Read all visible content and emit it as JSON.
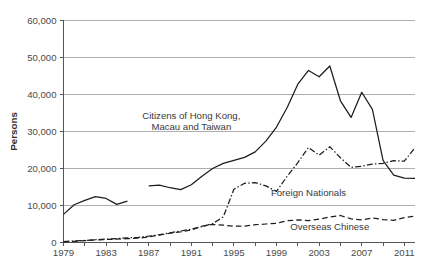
{
  "chart_data": {
    "type": "line",
    "title": "",
    "xlabel": "",
    "ylabel": "Persons",
    "xlim": [
      1979,
      2012
    ],
    "ylim": [
      0,
      60000
    ],
    "grid": true,
    "legend_position": "inline-annotations",
    "y_ticks": [
      0,
      10000,
      20000,
      30000,
      40000,
      50000,
      60000
    ],
    "y_tick_labels": [
      "0",
      "10,000",
      "20,000",
      "30,000",
      "40,000",
      "50,000",
      "60,000"
    ],
    "x_ticks": [
      1979,
      1983,
      1987,
      1991,
      1995,
      1999,
      2003,
      2007,
      2011
    ],
    "x_tick_labels": [
      "1979",
      "1983",
      "1987",
      "1991",
      "1995",
      "1999",
      "2003",
      "2007",
      "2011"
    ],
    "x_minor_tick_interval": 2,
    "series": [
      {
        "name": "Citizens of Hong Kong, Macau and Taiwan",
        "style": "solid",
        "annotation_lines": [
          "Citizens of Hong Kong,",
          "Macau and Taiwan"
        ],
        "annotation_x": 1991.0,
        "annotation_y": 33500,
        "x": [
          1979,
          1980,
          1981,
          1982,
          1983,
          1984,
          1985,
          1987,
          1988,
          1989,
          1990,
          1991,
          1992,
          1993,
          1994,
          1995,
          1996,
          1997,
          1998,
          1999,
          2000,
          2001,
          2002,
          2003,
          2004,
          2005,
          2006,
          2007,
          2008,
          2009,
          2010,
          2011,
          2012
        ],
        "y": [
          7600,
          10200,
          11400,
          12400,
          11900,
          10300,
          11200,
          15300,
          15500,
          14800,
          14300,
          15600,
          17900,
          20000,
          21400,
          22200,
          23000,
          24500,
          27400,
          31200,
          36500,
          42800,
          46500,
          44800,
          47700,
          38300,
          33800,
          40600,
          36000,
          22200,
          18200,
          17400,
          17300
        ]
      },
      {
        "name": "Foreign Nationals",
        "style": "dash-dot",
        "annotation_lines": [
          "Foreign Nationals"
        ],
        "annotation_x": 2002.0,
        "annotation_y": 12600,
        "x": [
          1979,
          1980,
          1981,
          1982,
          1983,
          1984,
          1985,
          1986,
          1987,
          1988,
          1989,
          1990,
          1991,
          1992,
          1993,
          1994,
          1995,
          1996,
          1997,
          1998,
          1999,
          2000,
          2001,
          2002,
          2003,
          2004,
          2005,
          2006,
          2007,
          2008,
          2009,
          2010,
          2011,
          2012
        ],
        "y": [
          260,
          400,
          550,
          760,
          900,
          1050,
          1250,
          1400,
          1700,
          2100,
          2600,
          3100,
          3600,
          4300,
          5100,
          6900,
          14400,
          16000,
          16200,
          15300,
          13800,
          17900,
          21600,
          25700,
          23600,
          25900,
          22900,
          20300,
          20600,
          21200,
          21400,
          22100,
          22000,
          25600
        ]
      },
      {
        "name": "Overseas Chinese",
        "style": "dashed",
        "annotation_lines": [
          "Overseas Chinese"
        ],
        "annotation_x": 2004.0,
        "annotation_y": 3400,
        "x": [
          1979,
          1980,
          1981,
          1982,
          1983,
          1984,
          1985,
          1986,
          1987,
          1988,
          1989,
          1990,
          1991,
          1992,
          1993,
          1994,
          1995,
          1996,
          1997,
          1998,
          1999,
          2000,
          2001,
          2002,
          2003,
          2004,
          2005,
          2006,
          2007,
          2008,
          2009,
          2010,
          2011,
          2012
        ],
        "y": [
          180,
          320,
          480,
          700,
          820,
          900,
          1050,
          1150,
          1500,
          2000,
          2500,
          2900,
          3400,
          4400,
          4900,
          4700,
          4400,
          4400,
          4800,
          5000,
          5200,
          5900,
          6100,
          5900,
          6300,
          6900,
          7300,
          6400,
          6100,
          6600,
          6200,
          6000,
          6700,
          7100
        ]
      }
    ]
  },
  "caption": {
    "text": ""
  }
}
